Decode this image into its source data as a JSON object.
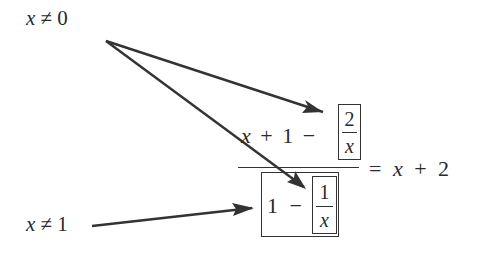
{
  "conditions": {
    "top": {
      "var": "x",
      "rel": "≠",
      "val": "0"
    },
    "bottom": {
      "var": "x",
      "rel": "≠",
      "val": "1"
    }
  },
  "equation": {
    "numerator": {
      "x": "x",
      "plus": "+",
      "one": "1",
      "minus": "−",
      "boxed_fraction": {
        "num": "2",
        "den": "x"
      }
    },
    "denominator": {
      "one": "1",
      "minus": "−",
      "boxed_fraction": {
        "num": "1",
        "den": "x"
      }
    },
    "rhs": {
      "equals": "=",
      "x": "x",
      "plus": "+",
      "two": "2"
    }
  },
  "arrows": [
    {
      "from": "x ≠ 0",
      "to": "2/x"
    },
    {
      "from": "x ≠ 0",
      "to": "1/x"
    },
    {
      "from": "x ≠ 1",
      "to": "1 − 1/x"
    }
  ],
  "colors": {
    "ink": "#2a2a2a",
    "arrow": "#333333",
    "background": "#ffffff"
  }
}
